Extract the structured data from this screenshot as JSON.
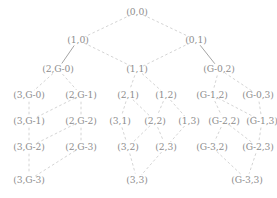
{
  "figure": {
    "kind": "hasse-lattice-diagram",
    "background_color": "#ffffff",
    "node_text_color": "#8d8d8d",
    "solid_edge_color": "#9a9a9a",
    "dashed_edge_color": "#c9c9c9",
    "width": 277,
    "height": 198
  },
  "nodes": [
    {
      "id": "n0",
      "label": "(0,0)",
      "x": 137,
      "y": 12,
      "row": 0
    },
    {
      "id": "n1",
      "label": "(1,0)",
      "x": 78,
      "y": 40,
      "row": 1
    },
    {
      "id": "n2",
      "label": "(0,1)",
      "x": 196,
      "y": 40,
      "row": 1
    },
    {
      "id": "n3",
      "label": "(2,G-0)",
      "x": 58,
      "y": 69,
      "row": 2
    },
    {
      "id": "n4",
      "label": "(1,1)",
      "x": 137,
      "y": 69,
      "row": 2
    },
    {
      "id": "n5",
      "label": "(G-0,2)",
      "x": 219,
      "y": 69,
      "row": 2
    },
    {
      "id": "n6",
      "label": "(3,G-0)",
      "x": 29,
      "y": 95,
      "row": 3
    },
    {
      "id": "n7",
      "label": "(2,G-1)",
      "x": 81,
      "y": 95,
      "row": 3
    },
    {
      "id": "n8",
      "label": "(2,1)",
      "x": 128,
      "y": 95,
      "row": 3
    },
    {
      "id": "n9",
      "label": "(1,2)",
      "x": 166,
      "y": 95,
      "row": 3
    },
    {
      "id": "n10",
      "label": "(G-1,2)",
      "x": 212,
      "y": 95,
      "row": 3
    },
    {
      "id": "n11",
      "label": "(G-0,3)",
      "x": 258,
      "y": 95,
      "row": 3
    },
    {
      "id": "n12",
      "label": "(3,G-1)",
      "x": 29,
      "y": 121,
      "row": 4
    },
    {
      "id": "n13",
      "label": "(2,G-2)",
      "x": 81,
      "y": 121,
      "row": 4
    },
    {
      "id": "n14",
      "label": "(3,1)",
      "x": 120,
      "y": 121,
      "row": 4
    },
    {
      "id": "n15",
      "label": "(2,2)",
      "x": 155,
      "y": 121,
      "row": 4
    },
    {
      "id": "n16",
      "label": "(1,3)",
      "x": 189,
      "y": 121,
      "row": 4
    },
    {
      "id": "n17",
      "label": "(G-2,2)",
      "x": 224,
      "y": 121,
      "row": 4
    },
    {
      "id": "n18",
      "label": "(G-1,3)",
      "x": 262,
      "y": 121,
      "row": 4
    },
    {
      "id": "n19",
      "label": "(3,G-2)",
      "x": 29,
      "y": 147,
      "row": 5
    },
    {
      "id": "n20",
      "label": "(2,G-3)",
      "x": 81,
      "y": 147,
      "row": 5
    },
    {
      "id": "n21",
      "label": "(3,2)",
      "x": 128,
      "y": 147,
      "row": 5
    },
    {
      "id": "n22",
      "label": "(2,3)",
      "x": 166,
      "y": 147,
      "row": 5
    },
    {
      "id": "n23",
      "label": "(G-3,2)",
      "x": 212,
      "y": 147,
      "row": 5
    },
    {
      "id": "n24",
      "label": "(G-2,3)",
      "x": 258,
      "y": 147,
      "row": 5
    },
    {
      "id": "n25",
      "label": "(3,G-3)",
      "x": 29,
      "y": 180,
      "row": 6
    },
    {
      "id": "n26",
      "label": "(3,3)",
      "x": 137,
      "y": 180,
      "row": 6
    },
    {
      "id": "n27",
      "label": "(G-3,3)",
      "x": 247,
      "y": 180,
      "row": 6
    }
  ],
  "edges": [
    {
      "from": "n0",
      "to": "n1",
      "style": "dashed"
    },
    {
      "from": "n0",
      "to": "n2",
      "style": "dashed"
    },
    {
      "from": "n1",
      "to": "n3",
      "style": "solid"
    },
    {
      "from": "n1",
      "to": "n4",
      "style": "dashed"
    },
    {
      "from": "n2",
      "to": "n4",
      "style": "dashed"
    },
    {
      "from": "n2",
      "to": "n5",
      "style": "solid"
    },
    {
      "from": "n3",
      "to": "n6",
      "style": "dashed"
    },
    {
      "from": "n3",
      "to": "n7",
      "style": "dashed"
    },
    {
      "from": "n4",
      "to": "n8",
      "style": "dashed"
    },
    {
      "from": "n4",
      "to": "n9",
      "style": "dashed"
    },
    {
      "from": "n5",
      "to": "n10",
      "style": "dashed"
    },
    {
      "from": "n5",
      "to": "n11",
      "style": "dashed"
    },
    {
      "from": "n6",
      "to": "n12",
      "style": "dashed"
    },
    {
      "from": "n7",
      "to": "n12",
      "style": "dashed"
    },
    {
      "from": "n7",
      "to": "n13",
      "style": "dashed"
    },
    {
      "from": "n8",
      "to": "n14",
      "style": "dashed"
    },
    {
      "from": "n8",
      "to": "n15",
      "style": "dashed"
    },
    {
      "from": "n9",
      "to": "n15",
      "style": "dashed"
    },
    {
      "from": "n9",
      "to": "n16",
      "style": "dashed"
    },
    {
      "from": "n10",
      "to": "n17",
      "style": "dashed"
    },
    {
      "from": "n10",
      "to": "n18",
      "style": "dashed"
    },
    {
      "from": "n11",
      "to": "n18",
      "style": "dashed"
    },
    {
      "from": "n12",
      "to": "n19",
      "style": "dashed"
    },
    {
      "from": "n13",
      "to": "n19",
      "style": "dashed"
    },
    {
      "from": "n13",
      "to": "n20",
      "style": "dashed"
    },
    {
      "from": "n14",
      "to": "n21",
      "style": "dashed"
    },
    {
      "from": "n15",
      "to": "n21",
      "style": "dashed"
    },
    {
      "from": "n15",
      "to": "n22",
      "style": "dashed"
    },
    {
      "from": "n16",
      "to": "n22",
      "style": "dashed"
    },
    {
      "from": "n17",
      "to": "n23",
      "style": "dashed"
    },
    {
      "from": "n17",
      "to": "n24",
      "style": "dashed"
    },
    {
      "from": "n18",
      "to": "n24",
      "style": "dashed"
    },
    {
      "from": "n19",
      "to": "n25",
      "style": "dashed"
    },
    {
      "from": "n20",
      "to": "n25",
      "style": "dashed"
    },
    {
      "from": "n21",
      "to": "n26",
      "style": "dashed"
    },
    {
      "from": "n22",
      "to": "n26",
      "style": "dashed"
    },
    {
      "from": "n23",
      "to": "n27",
      "style": "dashed"
    },
    {
      "from": "n24",
      "to": "n27",
      "style": "dashed"
    }
  ]
}
